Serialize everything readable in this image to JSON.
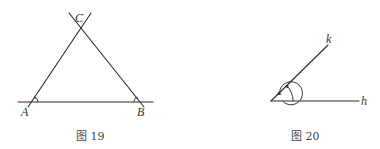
{
  "figures": [
    {
      "id": "fig19",
      "caption": "图 19",
      "type": "triangle",
      "points": {
        "A": {
          "label": "A",
          "x": 32,
          "y": 102
        },
        "B": {
          "label": "B",
          "x": 140,
          "y": 102
        },
        "C": {
          "label": "C",
          "x": 80,
          "y": 28
        }
      },
      "angle_marks": [
        "A",
        "B"
      ]
    },
    {
      "id": "fig20",
      "caption": "图 20",
      "type": "angle",
      "vertex": {
        "x": 271,
        "y": 101
      },
      "rays": [
        {
          "label": "k",
          "x": 328,
          "y": 45
        },
        {
          "label": "h",
          "x": 360,
          "y": 101
        }
      ],
      "angle_marks": [
        "inner-angle-hk",
        "reflex-angle-hk"
      ]
    }
  ],
  "colors": {
    "line": "#2a2a2a",
    "text": "#333333",
    "background": "#ffffff"
  }
}
